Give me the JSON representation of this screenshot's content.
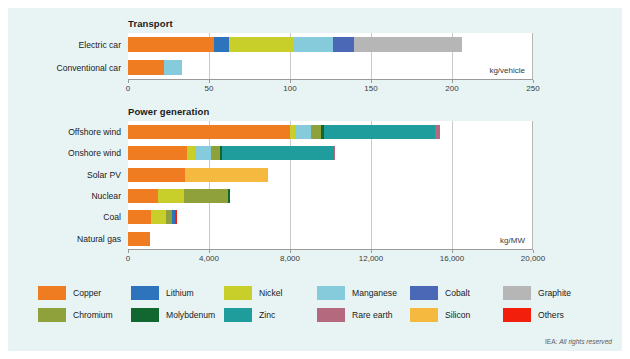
{
  "colors": {
    "background": "#e8f4f4",
    "plot_background": "#ffffff",
    "copper": "#f07c21",
    "lithium": "#2d74bd",
    "nickel": "#c9cf2a",
    "manganese": "#85cbdb",
    "cobalt": "#4a68b5",
    "graphite": "#b6b6b6",
    "chromium": "#8fa13a",
    "molybdenum": "#12662f",
    "zinc": "#1f9c9c",
    "rare_earth": "#b5697f",
    "silicon": "#f5b93f",
    "others": "#f21f0c"
  },
  "legend": {
    "items": [
      {
        "label": "Copper",
        "key": "copper"
      },
      {
        "label": "Lithium",
        "key": "lithium"
      },
      {
        "label": "Nickel",
        "key": "nickel"
      },
      {
        "label": "Manganese",
        "key": "manganese"
      },
      {
        "label": "Cobalt",
        "key": "cobalt"
      },
      {
        "label": "Graphite",
        "key": "graphite"
      },
      {
        "label": "Chromium",
        "key": "chromium"
      },
      {
        "label": "Molybdenum",
        "key": "molybdenum"
      },
      {
        "label": "Zinc",
        "key": "zinc"
      },
      {
        "label": "Rare earth",
        "key": "rare_earth"
      },
      {
        "label": "Silicon",
        "key": "silicon"
      },
      {
        "label": "Others",
        "key": "others"
      }
    ]
  },
  "credit": {
    "prefix": "IEA:",
    "text": "All rights reserved"
  },
  "chart_data": [
    {
      "type": "bar",
      "orientation": "horizontal",
      "stacked": true,
      "title": "Transport",
      "unit": "kg/vehicle",
      "xlabel": "",
      "ylabel": "",
      "xlim": [
        0,
        250
      ],
      "xticks": [
        0,
        50,
        100,
        150,
        200,
        250
      ],
      "xtick_labels": [
        "0",
        "50",
        "100",
        "150",
        "200",
        "250"
      ],
      "grid": true,
      "categories": [
        "Electric car",
        "Conventional car"
      ],
      "series": [
        {
          "name": "Copper",
          "key": "copper",
          "values": [
            53.2,
            22.3
          ]
        },
        {
          "name": "Lithium",
          "key": "lithium",
          "values": [
            8.9,
            0
          ]
        },
        {
          "name": "Nickel",
          "key": "nickel",
          "values": [
            39.9,
            0
          ]
        },
        {
          "name": "Manganese",
          "key": "manganese",
          "values": [
            24.5,
            11.2
          ]
        },
        {
          "name": "Cobalt",
          "key": "cobalt",
          "values": [
            13.3,
            0
          ]
        },
        {
          "name": "Graphite",
          "key": "graphite",
          "values": [
            66.3,
            0
          ]
        }
      ],
      "totals": [
        206.1,
        33.5
      ]
    },
    {
      "type": "bar",
      "orientation": "horizontal",
      "stacked": true,
      "title": "Power generation",
      "unit": "kg/MW",
      "xlabel": "",
      "ylabel": "",
      "xlim": [
        0,
        20000
      ],
      "xticks": [
        0,
        4000,
        8000,
        12000,
        16000,
        20000
      ],
      "xtick_labels": [
        "0",
        "4,000",
        "8,000",
        "12,000",
        "16,000",
        "20,000"
      ],
      "grid": true,
      "categories": [
        "Offshore wind",
        "Onshore wind",
        "Solar PV",
        "Nuclear",
        "Coal",
        "Natural gas"
      ],
      "series": [
        {
          "name": "Copper",
          "key": "copper",
          "values": [
            8000,
            2900,
            2800,
            1470,
            1150,
            1100
          ]
        },
        {
          "name": "Nickel",
          "key": "nickel",
          "values": [
            240,
            404,
            0,
            1300,
            720,
            0
          ]
        },
        {
          "name": "Manganese",
          "key": "manganese",
          "values": [
            790,
            780,
            0,
            0,
            0,
            0
          ]
        },
        {
          "name": "Chromium",
          "key": "chromium",
          "values": [
            525,
            470,
            0,
            2190,
            310,
            0
          ]
        },
        {
          "name": "Molybdenum",
          "key": "molybdenum",
          "values": [
            109,
            99,
            0,
            69,
            0,
            0
          ]
        },
        {
          "name": "Zinc",
          "key": "zinc",
          "values": [
            5500,
            5500,
            0,
            0,
            0,
            0
          ]
        },
        {
          "name": "Rare earth",
          "key": "rare_earth",
          "values": [
            239,
            14,
            0,
            0,
            0,
            0
          ]
        },
        {
          "name": "Silicon",
          "key": "silicon",
          "values": [
            0,
            0,
            4100,
            0,
            0,
            0
          ]
        },
        {
          "name": "Lithium",
          "key": "lithium",
          "values": [
            0,
            0,
            0,
            0,
            120,
            0
          ]
        },
        {
          "name": "Others",
          "key": "others",
          "values": [
            0,
            0,
            0,
            0,
            120,
            0
          ]
        }
      ],
      "totals": [
        15403,
        10167,
        6900,
        5029,
        2420,
        1100
      ]
    }
  ]
}
